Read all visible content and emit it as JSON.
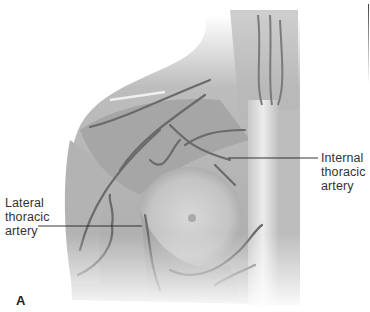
{
  "figure": {
    "panel_label": "A",
    "labels": [
      {
        "id": "internal",
        "text": "Internal\nthoracic\nartery",
        "leader": {
          "x1": 228,
          "y1": 158,
          "x2": 318,
          "y2": 158
        }
      },
      {
        "id": "lateral",
        "text": "Lateral\nthoracic\nartery",
        "leader": {
          "x1": 38,
          "y1": 226,
          "x2": 142,
          "y2": 226
        }
      }
    ],
    "colors": {
      "background": "#ffffff",
      "skin_tone": "#c9c9c9",
      "muscle_shade": "#a8a8a8",
      "vessel": "#6e6e6e",
      "sternum": "#e2e2e2",
      "label_text": "#333333",
      "leader_line": "#222222"
    }
  }
}
